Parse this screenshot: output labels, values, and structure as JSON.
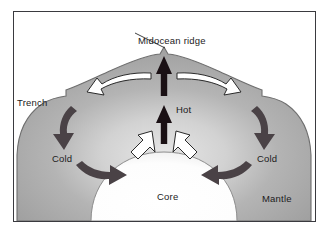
{
  "figure": {
    "type": "geology-cross-section-diagram",
    "frame": {
      "border_color": "#3a3a3f",
      "background": "#ffffff"
    },
    "colors": {
      "mantle_fill": "#a9a9a9",
      "mantle_highlight": "#d8d8d8",
      "mantle_outline": "#6e6e6e",
      "core_fill": "#ffffff",
      "hot_arrow": "#1a1014",
      "white_arrow_fill": "#ffffff",
      "white_arrow_outline": "#2a2a2a",
      "cold_arrow": "#4a4246",
      "leader_line": "#2a2a2a",
      "text": "#1b1b1b"
    },
    "labels": {
      "midocean_ridge": "Midocean ridge",
      "trench": "Trench",
      "hot": "Hot",
      "cold_left": "Cold",
      "cold_right": "Cold",
      "core": "Core",
      "mantle": "Mantle"
    },
    "layers": [
      {
        "name": "mantle",
        "label": "Mantle",
        "fill": "#a9a9a9"
      },
      {
        "name": "core",
        "label": "Core",
        "fill": "#ffffff"
      }
    ],
    "features": [
      {
        "name": "midocean-ridge",
        "label": "Midocean ridge",
        "position": "top-center",
        "description": "small triangular peak at crest of arc"
      },
      {
        "name": "trench-left",
        "label": "Trench",
        "position": "upper-left",
        "description": "notch step in mantle outline"
      },
      {
        "name": "trench-right",
        "label": "",
        "position": "upper-right",
        "description": "notch step in mantle outline"
      }
    ],
    "arrows": [
      {
        "name": "hot-upwelling-upper",
        "style": "solid-black",
        "direction": "up",
        "label": "Hot"
      },
      {
        "name": "hot-upwelling-lower",
        "style": "solid-black",
        "direction": "up",
        "label": "Hot"
      },
      {
        "name": "spreading-left",
        "style": "white-outline",
        "direction": "left",
        "label": ""
      },
      {
        "name": "spreading-right",
        "style": "white-outline",
        "direction": "right",
        "label": ""
      },
      {
        "name": "subduction-left",
        "style": "dark-gray",
        "direction": "down",
        "label": "Cold"
      },
      {
        "name": "subduction-right",
        "style": "dark-gray",
        "direction": "down",
        "label": "Cold"
      },
      {
        "name": "return-flow-left",
        "style": "dark-gray",
        "direction": "right",
        "label": ""
      },
      {
        "name": "return-flow-right",
        "style": "dark-gray",
        "direction": "left",
        "label": ""
      },
      {
        "name": "upwelling-feed-left",
        "style": "white-outline",
        "direction": "up-right",
        "label": ""
      },
      {
        "name": "upwelling-feed-right",
        "style": "white-outline",
        "direction": "up-left",
        "label": ""
      }
    ]
  }
}
